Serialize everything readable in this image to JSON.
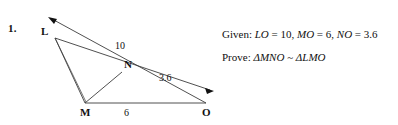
{
  "problem": {
    "number": "1."
  },
  "figure": {
    "vertices": [
      {
        "name": "L",
        "label": "L",
        "x": 55,
        "y": 38
      },
      {
        "name": "M",
        "label": "M",
        "x": 85,
        "y": 103
      },
      {
        "name": "N",
        "label": "N",
        "x": 122,
        "y": 72
      },
      {
        "name": "O",
        "label": "O",
        "x": 206,
        "y": 103
      }
    ],
    "measure_labels": [
      {
        "name": "LN-measure",
        "text": "10"
      },
      {
        "name": "NO-measure",
        "text": "3.6"
      },
      {
        "name": "MO-measure",
        "text": "6"
      }
    ],
    "stroke_color": "#3c3c3c",
    "arrow_color": "#111111"
  },
  "statements": {
    "given": {
      "lead": "Given:",
      "terms": [
        {
          "var": "LO",
          "eq": " = 10,",
          "name": "given-term-LO"
        },
        {
          "var": "MO",
          "eq": " = 6,",
          "name": "given-term-MO"
        },
        {
          "var": "NO",
          "eq": " = 3.6",
          "name": "given-term-NO"
        }
      ]
    },
    "prove": {
      "lead": "Prove:",
      "triangle1": "ΔMNO",
      "similar_symbol": "~",
      "triangle2": "ΔLMO"
    }
  }
}
